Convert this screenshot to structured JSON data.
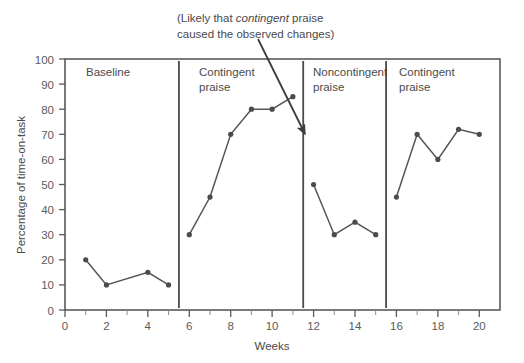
{
  "chart_data": {
    "type": "line",
    "title": "",
    "xlabel": "Weeks",
    "ylabel": "Percentage of time-on-task",
    "xlim": [
      0,
      21
    ],
    "ylim": [
      0,
      100
    ],
    "xticks": [
      0,
      2,
      4,
      6,
      8,
      10,
      12,
      14,
      16,
      18,
      20
    ],
    "xtick_labels": [
      "0",
      "2",
      "4",
      "6",
      "8",
      "10",
      "12",
      "14",
      "16",
      "18",
      "20"
    ],
    "xminor_ticks": [
      1,
      3,
      5,
      7,
      9,
      11,
      13,
      15,
      17,
      19
    ],
    "yticks": [
      0,
      10,
      20,
      30,
      40,
      50,
      60,
      70,
      80,
      90,
      100
    ],
    "ytick_labels": [
      "0",
      "10",
      "20",
      "30",
      "40",
      "50",
      "60",
      "70",
      "80",
      "90",
      "100"
    ],
    "grid": false,
    "legend": "none",
    "marker": "filled-circle",
    "line_color": "#55555a",
    "marker_color": "#4a4a50",
    "frame_color": "#5a5a5a",
    "phases": [
      {
        "name": "Baseline",
        "label_lines": [
          "Baseline"
        ],
        "x_start": 0,
        "x_end": 5.5,
        "x": [
          1,
          2,
          4,
          5
        ],
        "values": [
          20,
          10,
          15,
          10
        ]
      },
      {
        "name": "Contingent praise",
        "label_lines": [
          "Contingent",
          "praise"
        ],
        "x_start": 5.5,
        "x_end": 11.5,
        "x": [
          6,
          7,
          8,
          9,
          10,
          11
        ],
        "values": [
          30,
          45,
          70,
          80,
          80,
          85
        ]
      },
      {
        "name": "Noncontingent praise",
        "label_lines": [
          "Noncontingent",
          "praise"
        ],
        "x_start": 11.5,
        "x_end": 15.5,
        "x": [
          12,
          13,
          14,
          15
        ],
        "values": [
          50,
          30,
          35,
          30
        ]
      },
      {
        "name": "Contingent praise",
        "label_lines": [
          "Contingent",
          "praise"
        ],
        "x_start": 15.5,
        "x_end": 21,
        "x": [
          16,
          17,
          18,
          19,
          20
        ],
        "values": [
          45,
          70,
          60,
          72,
          70
        ]
      }
    ],
    "phase_dividers": [
      5.5,
      11.5,
      15.5
    ],
    "annotations": [
      {
        "name": "causal-note",
        "line1_pre": "(Likely that ",
        "line1_em": "contingent",
        "line1_post": " praise",
        "line2": "caused the observed changes)",
        "arrow_from_x": 258,
        "arrow_from_y": 39,
        "arrow_to_x": 305,
        "arrow_to_y": 134
      }
    ]
  }
}
